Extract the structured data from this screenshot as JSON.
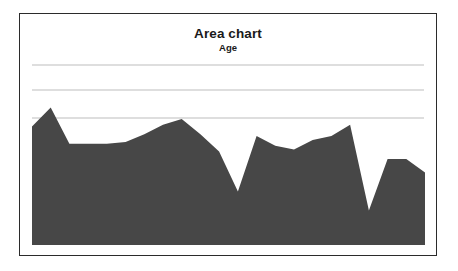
{
  "chart_data": {
    "type": "area",
    "title": "Area chart",
    "subtitle": "Age",
    "xlabel": "",
    "ylabel": "",
    "grid": true,
    "gridlines_y": [
      75,
      50,
      25
    ],
    "legend": "none",
    "ylim": [
      0,
      100
    ],
    "xlim": [
      0,
      21
    ],
    "series": [
      {
        "name": "Age",
        "fill_color": "#474747",
        "x": [
          0,
          1,
          2,
          3,
          4,
          5,
          6,
          7,
          8,
          9,
          10,
          11,
          12,
          13,
          14,
          15,
          16,
          17,
          18,
          19,
          20,
          21
        ],
        "values": [
          62,
          72,
          53,
          53,
          53,
          54,
          58,
          63,
          66,
          58,
          49,
          28,
          57,
          52,
          50,
          55,
          57,
          63,
          18,
          45,
          45,
          38
        ]
      }
    ],
    "tick_labels_x": [],
    "tick_labels_y": []
  },
  "colors": {
    "area_fill": "#474747",
    "gridline": "#bdbdbd",
    "card_border": "#2b2b2b",
    "background": "#ffffff",
    "text": "#1a1a1a"
  }
}
